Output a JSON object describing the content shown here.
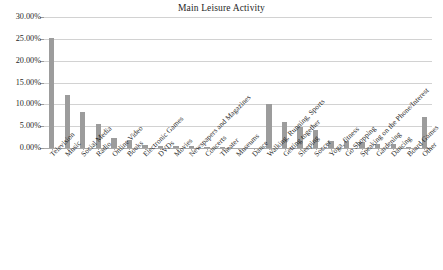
{
  "chart_data": {
    "type": "bar",
    "title": "Main Leisure Activity",
    "xlabel": "",
    "ylabel": "",
    "ylim": [
      0,
      30
    ],
    "yticks": [
      0,
      5,
      10,
      15,
      20,
      25,
      30
    ],
    "ytick_labels": [
      "0.00%",
      "5.00%",
      "10.00%",
      "15.00%",
      "20.00%",
      "25.00%",
      "30.00%"
    ],
    "grid": true,
    "legend": false,
    "bar_color": "#9c9c9c",
    "categories": [
      "Television",
      "Music",
      "Social Media",
      "Radio",
      "Online Video",
      "Books",
      "Electronic Games",
      "DVDs",
      "Movies",
      "Newspapers and Magazines",
      "Concerts",
      "Theater",
      "Museums",
      "Dance",
      "Walking, Running, Sports",
      "Getting together",
      "Sleeping",
      "Soccer",
      "Yoga, fitness",
      "Go Shopping",
      "Speaking on the Phone/Interest",
      "Gardening",
      "Dancing",
      "Board Games",
      "Other"
    ],
    "values": [
      25.2,
      12.2,
      8.3,
      5.6,
      2.4,
      1.9,
      0.7,
      0.5,
      0.4,
      0.5,
      0.2,
      0.05,
      0.0,
      0.0,
      10.0,
      5.9,
      4.9,
      4.2,
      1.6,
      1.5,
      1.3,
      1.0,
      0.9,
      0.2,
      7.2
    ]
  }
}
